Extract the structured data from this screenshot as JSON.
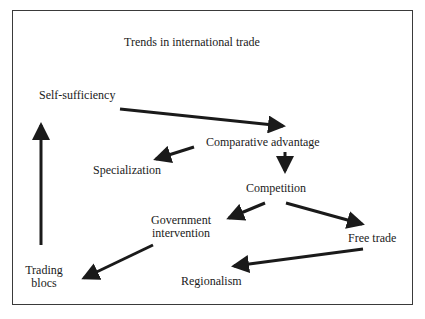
{
  "diagram": {
    "title": "Trends in international trade",
    "nodes": [
      {
        "id": "self_sufficiency",
        "label": "Self-sufficiency"
      },
      {
        "id": "comparative_advantage",
        "label": "Comparative advantage"
      },
      {
        "id": "specialization",
        "label": "Specialization"
      },
      {
        "id": "competition",
        "label": "Competition"
      },
      {
        "id": "government_intervention",
        "label_line1": "Government",
        "label_line2": "intervention"
      },
      {
        "id": "free_trade",
        "label": "Free trade"
      },
      {
        "id": "trading_blocs",
        "label_line1": "Trading",
        "label_line2": "blocs"
      },
      {
        "id": "regionalism",
        "label": "Regionalism"
      }
    ],
    "edges": [
      {
        "from": "self_sufficiency",
        "to": "comparative_advantage"
      },
      {
        "from": "comparative_advantage",
        "to": "specialization"
      },
      {
        "from": "comparative_advantage",
        "to": "competition"
      },
      {
        "from": "competition",
        "to": "government_intervention"
      },
      {
        "from": "competition",
        "to": "free_trade"
      },
      {
        "from": "government_intervention",
        "to": "trading_blocs"
      },
      {
        "from": "free_trade",
        "to": "regionalism"
      },
      {
        "from": "trading_blocs",
        "to": "self_sufficiency"
      }
    ],
    "colors": {
      "ink": "#1a1a1a",
      "border": "#3a3a3a",
      "background": "#ffffff"
    }
  }
}
